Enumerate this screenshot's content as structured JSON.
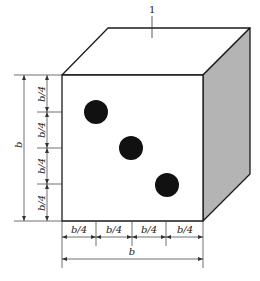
{
  "diagram": {
    "callout": {
      "label": "1",
      "x": 152,
      "y": 12
    },
    "cube": {
      "front": {
        "x1": 62,
        "y1": 75,
        "x2": 203,
        "y2": 221
      },
      "back_offset": {
        "dx": 47,
        "dy": -47
      },
      "top_fill": "#ffffff",
      "side_fill": "#b4b4b4",
      "front_fill": "#ffffff",
      "stroke": "#1a1a1a"
    },
    "pips": [
      {
        "cx": 96,
        "cy": 112,
        "r": 12
      },
      {
        "cx": 131,
        "cy": 148,
        "r": 12
      },
      {
        "cx": 167,
        "cy": 185,
        "r": 12
      }
    ],
    "pip_color": "#111111",
    "vertical_dimension": {
      "total_label": "b",
      "segment_labels": [
        "b/4",
        "b/4",
        "b/4",
        "b/4"
      ]
    },
    "horizontal_dimension": {
      "total_label": "b",
      "segment_labels": [
        "b/4",
        "b/4",
        "b/4",
        "b/4"
      ]
    }
  }
}
